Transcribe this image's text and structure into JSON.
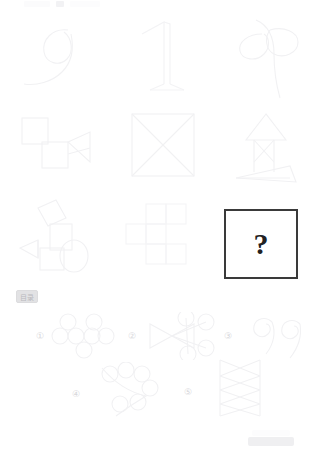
{
  "app": {
    "type": "visual-reasoning-quiz",
    "background_color": "#ffffff",
    "ink_color": "#f1f1f3",
    "answer_box_border_color": "#3a3a3a"
  },
  "top_strip": {
    "visible": true,
    "chip_color": "#f2f2f4"
  },
  "matrix": {
    "rows": 3,
    "columns": 3,
    "cells": [
      {
        "position": "r1c1",
        "icon": "curl-nine-shape",
        "label": "9"
      },
      {
        "position": "r1c2",
        "icon": "numeral-one-shape",
        "label": "1"
      },
      {
        "position": "r1c3",
        "icon": "sprout-two-leaves-shape",
        "label": "sprout"
      },
      {
        "position": "r2c1",
        "icon": "squares-with-triangle-shape",
        "label": "squares+triangle"
      },
      {
        "position": "r2c2",
        "icon": "square-with-diagonals-shape",
        "label": "square with X"
      },
      {
        "position": "r2c3",
        "icon": "tower-triangle-roof-shape",
        "label": "tower"
      },
      {
        "position": "r3c1",
        "icon": "shapes-cluster-ellipse-shape",
        "label": "shape cluster"
      },
      {
        "position": "r3c2",
        "icon": "cube-net-squares-shape",
        "label": "cube net"
      },
      {
        "position": "r3c3",
        "icon": "question-box",
        "label": "?"
      }
    ]
  },
  "answer_box": {
    "question_mark": "?",
    "border_color": "#3a3a3a",
    "fill_color": "#ffffff"
  },
  "toolbar": {
    "button_label": "目录",
    "button_color": "#e2e2e4"
  },
  "options": [
    {
      "number": "①",
      "id": "option-1",
      "icon": "circle-cluster-shape",
      "description": "cluster of seven circles"
    },
    {
      "number": "②",
      "id": "option-2",
      "icon": "bowtie-triangles-circles-shape",
      "description": "bowtie triangles with circles"
    },
    {
      "number": "③",
      "id": "option-3",
      "icon": "double-spiral-curl-shape",
      "description": "two spiral curls"
    },
    {
      "number": "④",
      "id": "option-4",
      "icon": "circles-along-curve-shape",
      "description": "circles strung along an S curve"
    },
    {
      "number": "⑤",
      "id": "option-5",
      "icon": "lattice-truss-shape",
      "description": "vertical lattice truss"
    }
  ],
  "bottom_control": {
    "visible": true,
    "color": "#efeff1"
  }
}
